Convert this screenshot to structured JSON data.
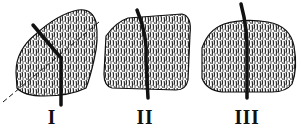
{
  "figure": {
    "specimens": [
      {
        "id": "specimen-1",
        "label": "I"
      },
      {
        "id": "specimen-2",
        "label": "II"
      },
      {
        "id": "specimen-3",
        "label": "III"
      }
    ],
    "colors": {
      "ink": "#111111",
      "fill": "#bdbdbd",
      "background": "#ffffff"
    }
  }
}
